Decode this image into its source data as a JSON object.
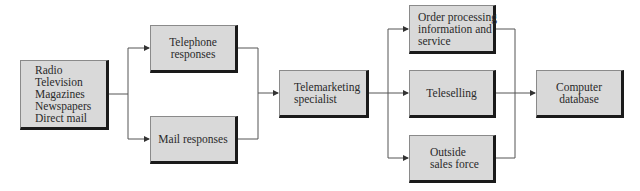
{
  "diagram": {
    "type": "flowchart",
    "colors": {
      "box_fill": "#d9d9d9",
      "box_shadow": "#1a1a1a",
      "line": "#555555"
    },
    "nodes": {
      "sources": {
        "lines": [
          "Radio",
          "Television",
          "Magazines",
          "Newspapers",
          "Direct mail"
        ]
      },
      "telephone": {
        "lines": [
          "Telephone",
          "responses"
        ]
      },
      "mail": {
        "lines": [
          "Mail responses"
        ]
      },
      "specialist": {
        "lines": [
          "Telemarketing",
          "specialist"
        ]
      },
      "order": {
        "lines": [
          "Order processing",
          "information and",
          "service"
        ]
      },
      "teleselling": {
        "lines": [
          "Teleselling"
        ]
      },
      "outside": {
        "lines": [
          "Outside",
          "sales force"
        ]
      },
      "database": {
        "lines": [
          "Computer",
          "database"
        ]
      }
    },
    "edges": [
      [
        "sources",
        "telephone"
      ],
      [
        "sources",
        "mail"
      ],
      [
        "telephone",
        "specialist"
      ],
      [
        "mail",
        "specialist"
      ],
      [
        "specialist",
        "order"
      ],
      [
        "specialist",
        "teleselling"
      ],
      [
        "specialist",
        "outside"
      ],
      [
        "order",
        "database"
      ],
      [
        "teleselling",
        "database"
      ],
      [
        "outside",
        "database"
      ]
    ]
  }
}
